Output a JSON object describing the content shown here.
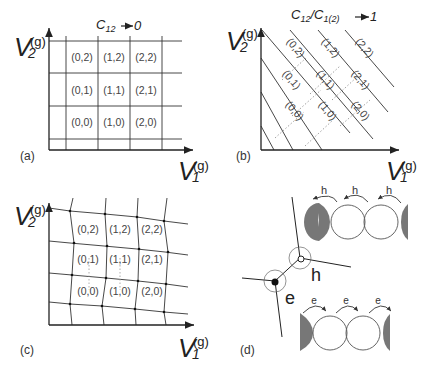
{
  "figure": {
    "panels": [
      {
        "id": "a",
        "label": "(a)",
        "title_main": "C",
        "title_sub": "12",
        "title_arrow_value": "0",
        "x_axis": {
          "symbol": "V",
          "sub": "1",
          "sup": "(g)"
        },
        "y_axis": {
          "symbol": "V",
          "sub": "2",
          "sup": "(g)"
        },
        "cells": [
          "(0,2)",
          "(1,2)",
          "(2,2)",
          "(0,1)",
          "(1,1)",
          "(2,1)",
          "(0,0)",
          "(1,0)",
          "(2,0)"
        ]
      },
      {
        "id": "b",
        "label": "(b)",
        "title_main": "C",
        "title_sub": "12",
        "title_slash": "/C",
        "title_sub2": "1(2)",
        "title_arrow_value": "1",
        "x_axis": {
          "symbol": "V",
          "sub": "1",
          "sup": "(g)"
        },
        "y_axis": {
          "symbol": "V",
          "sub": "2",
          "sup": "(g)"
        },
        "cells": [
          "(0,2)",
          "(1,2)",
          "(2,2)",
          "(0,1)",
          "(1,1)",
          "(2,1)",
          "(0,0)",
          "(1,0)",
          "(2,0)"
        ]
      },
      {
        "id": "c",
        "label": "(c)",
        "x_axis": {
          "symbol": "V",
          "sub": "1",
          "sup": "(g)"
        },
        "y_axis": {
          "symbol": "V",
          "sub": "2",
          "sup": "(g)"
        },
        "cells": [
          "(0,2)",
          "(1,2)",
          "(2,2)",
          "(0,1)",
          "(1,1)",
          "(2,1)",
          "(0,0)",
          "(1,0)",
          "(2,0)"
        ]
      },
      {
        "id": "d",
        "label": "(d)",
        "triple_point_labels": {
          "hole": "h",
          "electron": "e"
        },
        "hole_transport_labels": [
          "h",
          "h",
          "h"
        ],
        "electron_transport_labels": [
          "e",
          "e",
          "e"
        ]
      }
    ]
  }
}
